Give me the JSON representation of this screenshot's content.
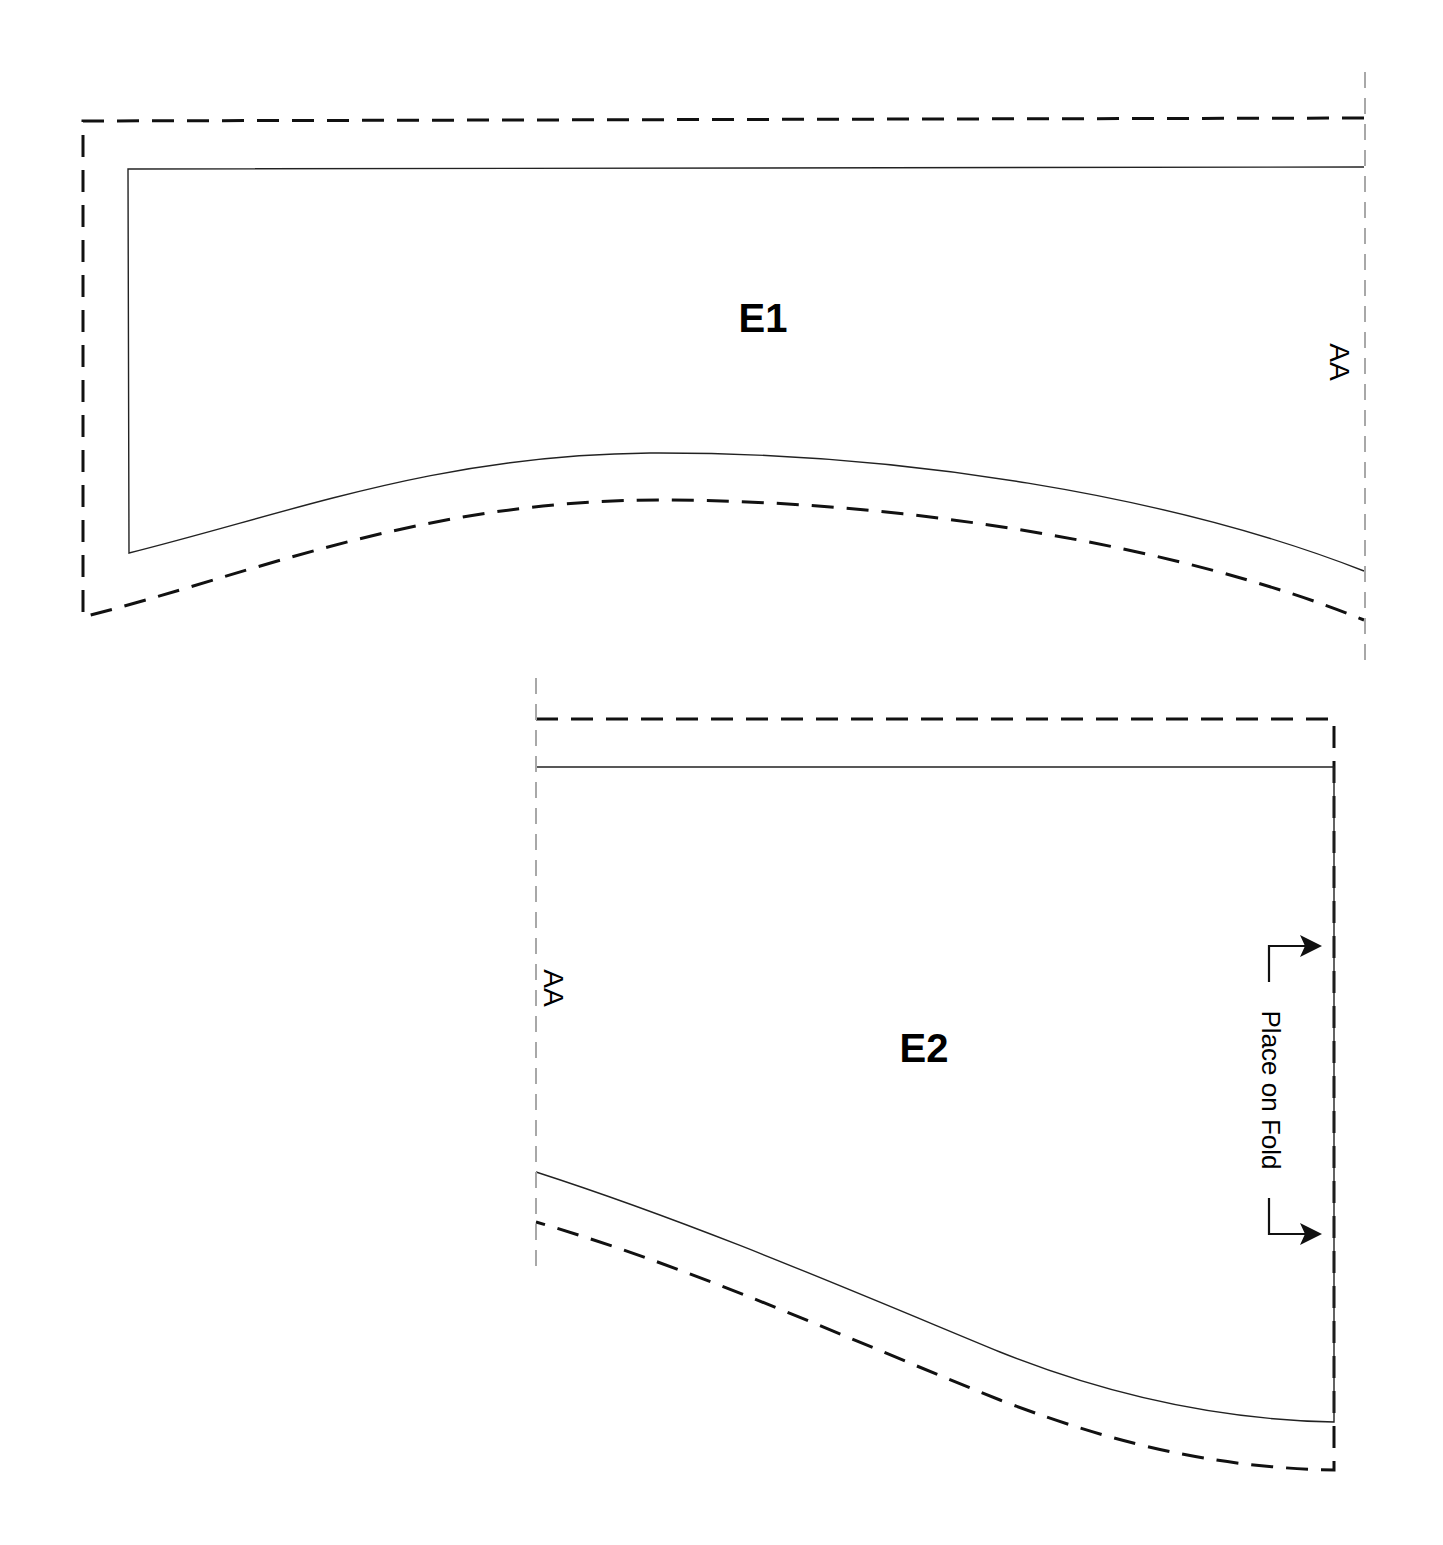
{
  "diagram": {
    "type": "sewing-pattern",
    "colors": {
      "background": "#ffffff",
      "cut_line": "#111111",
      "stitch_line": "#222222",
      "match_line": "#a8a8a8"
    },
    "pieces": [
      {
        "id": "E1",
        "label": "E1",
        "match_mark": "AA",
        "match_side": "right"
      },
      {
        "id": "E2",
        "label": "E2",
        "match_mark": "AA",
        "match_side": "left",
        "fold_instruction": "Place on Fold",
        "fold_side": "right"
      }
    ],
    "legend": {
      "dashed_black": "cutting line (seam allowance)",
      "solid_thin": "stitching line",
      "dashed_gray": "matching edge AA"
    }
  }
}
